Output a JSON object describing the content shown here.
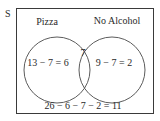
{
  "diagram": {
    "type": "venn",
    "universe_label": "S",
    "sets": [
      {
        "label": "Pizza",
        "only_region": "13 − 7 = 6"
      },
      {
        "label": "No Alcohol",
        "only_region": "9 − 7 = 2"
      }
    ],
    "intersection": "7",
    "outside": "26 − 6 − 7 − 2 = 11",
    "colors": {
      "stroke": "#3a3a3a",
      "background": "#ffffff"
    }
  }
}
